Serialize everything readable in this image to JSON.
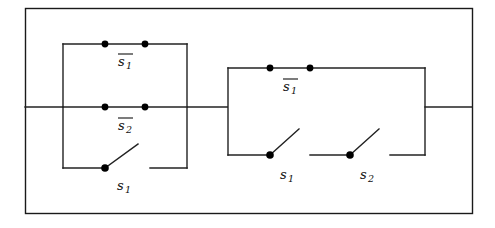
{
  "figure": {
    "kind": "switching-circuit-diagram",
    "frame": {
      "name": "outer-border",
      "x": 25,
      "y": 8,
      "width": 447,
      "height": 205,
      "color": "#1a1a1a"
    },
    "line_color": "#222222",
    "node_color": "#000000"
  },
  "left_network": {
    "name": "left-parallel-block",
    "box": {
      "x": 63,
      "y": 44,
      "right": 187,
      "bottom": 168
    },
    "lead_in": {
      "from_x": 25,
      "to_x": 63,
      "y": 107
    },
    "branches": [
      {
        "id": "left-top-branch",
        "label": "s",
        "subscript": "1",
        "negated": true,
        "label_text": "s̅1",
        "type": "closed-contact",
        "y": 44,
        "node_x": [
          105,
          145
        ]
      },
      {
        "id": "left-middle-branch",
        "label": "s",
        "subscript": "2",
        "negated": true,
        "label_text": "s̅2",
        "type": "closed-contact",
        "y": 107,
        "node_x": [
          105,
          145
        ]
      },
      {
        "id": "left-bottom-branch",
        "label": "s",
        "subscript": "1",
        "negated": false,
        "label_text": "s1",
        "type": "open-switch",
        "y": 168,
        "pivot_x": 105,
        "blade_tip_x": 137,
        "blade_tip_y": 145,
        "gap_resume_x": 150
      }
    ]
  },
  "connector": {
    "name": "middle-connector-wire",
    "from_x": 187,
    "to_x": 228,
    "y": 107
  },
  "right_network": {
    "name": "right-parallel-block",
    "box": {
      "x": 228,
      "y": 68,
      "right": 425,
      "bottom": 155
    },
    "lead_out": {
      "from_x": 425,
      "to_x": 472,
      "y": 107
    },
    "branches": [
      {
        "id": "right-top-branch",
        "label": "s",
        "subscript": "1",
        "negated": true,
        "label_text": "s̅1",
        "type": "closed-contact",
        "y": 68,
        "node_x": [
          270,
          310
        ]
      },
      {
        "id": "right-bottom-branch-s1",
        "label": "s",
        "subscript": "1",
        "negated": false,
        "label_text": "s1",
        "type": "open-switch",
        "y": 155,
        "pivot_x": 270,
        "blade_tip_x": 298,
        "blade_tip_y": 130,
        "segment_from_x": 228,
        "segment_to_x": 270
      },
      {
        "id": "right-bottom-branch-s2",
        "label": "s",
        "subscript": "2",
        "negated": false,
        "label_text": "s2",
        "type": "open-switch",
        "y": 155,
        "pivot_x": 350,
        "blade_tip_x": 378,
        "blade_tip_y": 130,
        "segment_from_x": 310,
        "segment_to_x": 350,
        "segment2_from_x": 390,
        "segment2_to_x": 425
      }
    ]
  },
  "labels": {
    "left_top": {
      "base": "s",
      "sub": "1",
      "bar": true,
      "x": 125,
      "y": 65
    },
    "left_middle": {
      "base": "s",
      "sub": "2",
      "bar": true,
      "x": 125,
      "y": 129
    },
    "left_bottom": {
      "base": "s",
      "sub": "1",
      "bar": false,
      "x": 124,
      "y": 189
    },
    "right_top": {
      "base": "s",
      "sub": "1",
      "bar": true,
      "x": 290,
      "y": 90
    },
    "right_bottom_s1": {
      "base": "s",
      "sub": "1",
      "bar": false,
      "x": 287,
      "y": 178
    },
    "right_bottom_s2": {
      "base": "s",
      "sub": "2",
      "bar": false,
      "x": 367,
      "y": 178
    }
  }
}
